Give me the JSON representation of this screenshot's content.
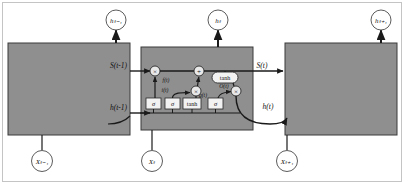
{
  "figure": {
    "name": "unfolded-lstm-recurrent-network",
    "colors": {
      "cell_fill": "#8f8f8f",
      "cell_stroke": "#3a3a3a",
      "line": "#1a1a1a",
      "node_fill": "#ffffff",
      "gate_fill": "#f2f2f2",
      "background": "#ffffff",
      "outer_border": "#b9b9b9"
    }
  },
  "outputs": [
    {
      "id": "h-prev-output",
      "label": "hₜ₋₁"
    },
    {
      "id": "h-output",
      "label": "hₜ"
    },
    {
      "id": "h-next-output",
      "label": "hₜ₊₁"
    }
  ],
  "inputs": [
    {
      "id": "x-prev-input",
      "label": "Xₜ₋₁"
    },
    {
      "id": "x-input",
      "label": "Xₜ"
    },
    {
      "id": "x-next-input",
      "label": "Xₜ₊₁"
    }
  ],
  "cells": [
    {
      "id": "cell-prev",
      "label": ""
    },
    {
      "id": "cell-center",
      "label": ""
    },
    {
      "id": "cell-next",
      "label": ""
    }
  ],
  "state_labels": {
    "state_in": "S(t-1)",
    "state_out": "S(t)",
    "hidden_in": "h(t-1)",
    "hidden_out": "h(t)"
  },
  "gates": [
    {
      "id": "forget-gate",
      "symbol": "σ",
      "signal": "f(t)"
    },
    {
      "id": "input-gate",
      "symbol": "σ",
      "signal": "i(t)"
    },
    {
      "id": "candidate-gate",
      "symbol": "tanh",
      "signal": ""
    },
    {
      "id": "output-gate",
      "symbol": "σ",
      "signal": "O(t)"
    }
  ],
  "operators": [
    {
      "id": "forget-multiply",
      "symbol": "×"
    },
    {
      "id": "state-add",
      "symbol": "+"
    },
    {
      "id": "input-multiply",
      "symbol": "×"
    },
    {
      "id": "output-multiply",
      "symbol": "×"
    }
  ],
  "activation_block": {
    "id": "state-tanh",
    "label": "tanh"
  },
  "signal_labels": {
    "forget": "f(t)",
    "input": "i(t)",
    "candidate": "g(t)",
    "output": "O(t)"
  }
}
